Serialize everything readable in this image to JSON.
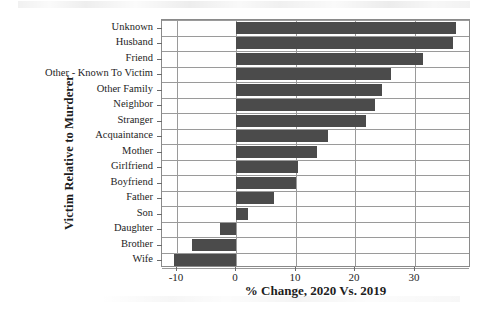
{
  "chart_data": {
    "type": "bar",
    "orientation": "horizontal",
    "title": "",
    "xlabel": "% Change, 2020 Vs. 2019",
    "ylabel": "Victim Relative to Murderer",
    "categories": [
      "Unknown",
      "Husband",
      "Friend",
      "Other - Known To Victim",
      "Other Family",
      "Neighbor",
      "Stranger",
      "Acquaintance",
      "Mother",
      "Girlfriend",
      "Boyfriend",
      "Father",
      "Son",
      "Daughter",
      "Brother",
      "Wife"
    ],
    "values": [
      37.0,
      36.5,
      31.5,
      26.0,
      24.5,
      23.3,
      21.8,
      15.4,
      13.6,
      10.4,
      10.0,
      6.3,
      2.0,
      -2.8,
      -7.5,
      -10.5
    ],
    "xlim": [
      -12.5,
      39.5
    ],
    "xticks": [
      -10,
      0,
      10,
      20,
      30
    ],
    "xticklabels": [
      "-10",
      "0",
      "10",
      "20",
      "30"
    ],
    "grid": "both",
    "legend": "none",
    "bar_color": "#4b4b4b",
    "axis_color": "#8a8a8a"
  }
}
